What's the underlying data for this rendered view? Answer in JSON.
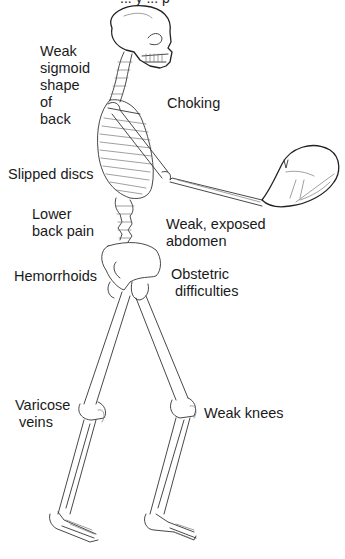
{
  "diagram": {
    "title_fragment": "... y ... p",
    "labels": {
      "weak_sigmoid": "Weak\nsigmoid\nshape\nof\nback",
      "choking": "Choking",
      "slipped_discs": "Slipped discs",
      "lower_back_pain": "Lower\nback pain",
      "weak_abdomen": "Weak, exposed\nabdomen",
      "hemorrhoids": "Hemorrhoids",
      "obstetric": "Obstetric\n difficulties",
      "varicose": "Varicose\n veins",
      "weak_knees": "Weak knees"
    }
  }
}
